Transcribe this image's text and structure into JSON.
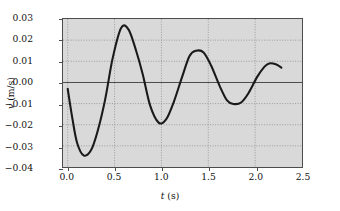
{
  "chart_data": {
    "type": "line",
    "title": "",
    "xlabel": "t (s)",
    "ylabel": "v (m/s)",
    "xlim": [
      -0.05,
      2.5
    ],
    "ylim": [
      -0.04,
      0.03
    ],
    "xticks": [
      "0.0",
      "0.5",
      "1.0",
      "1.5",
      "2.0",
      "2.5"
    ],
    "xtick_values": [
      0.0,
      0.5,
      1.0,
      1.5,
      2.0,
      2.5
    ],
    "yticks": [
      "0.03",
      "0.02",
      "0.01",
      "0.00",
      "-0.01",
      "-0.02",
      "-0.03",
      "-0.04"
    ],
    "ytick_values": [
      0.03,
      0.02,
      0.01,
      0.0,
      -0.01,
      -0.02,
      -0.03,
      -0.04
    ],
    "grid": true,
    "grid_style": "dotted",
    "legend": "none",
    "plot_bg_color": "#d9d9d9",
    "curve_color": "#1a1a1a",
    "zero_line_color": "#4d4d4d",
    "series": [
      {
        "name": "v(t)",
        "description": "damped oscillation",
        "x": [
          0.0,
          0.05,
          0.1,
          0.17,
          0.25,
          0.32,
          0.4,
          0.48,
          0.57,
          0.65,
          0.73,
          0.8,
          0.88,
          0.97,
          1.05,
          1.13,
          1.22,
          1.3,
          1.37,
          1.45,
          1.53,
          1.62,
          1.7,
          1.77,
          1.85,
          1.93,
          2.02,
          2.1,
          2.15,
          2.22,
          2.28
        ],
        "y": [
          -0.003,
          -0.017,
          -0.0285,
          -0.0345,
          -0.032,
          -0.023,
          -0.008,
          0.0115,
          0.0258,
          0.025,
          0.015,
          0.004,
          -0.011,
          -0.019,
          -0.0175,
          -0.0095,
          0.0025,
          0.0125,
          0.015,
          0.0142,
          0.008,
          -0.0015,
          -0.0085,
          -0.0102,
          -0.0095,
          -0.005,
          0.0025,
          0.0075,
          0.009,
          0.0086,
          0.007
        ]
      }
    ],
    "key_points": {
      "start": {
        "t": 0.0,
        "v": -0.003
      },
      "trough_1": {
        "t": 0.17,
        "v": -0.0345
      },
      "peak_1": {
        "t": 0.57,
        "v": 0.0258
      },
      "trough_2": {
        "t": 0.97,
        "v": -0.019
      },
      "peak_2": {
        "t": 1.37,
        "v": 0.015
      },
      "trough_3": {
        "t": 1.77,
        "v": -0.0102
      },
      "peak_3": {
        "t": 2.15,
        "v": 0.009
      },
      "end": {
        "t": 2.28,
        "v": 0.007
      }
    }
  }
}
